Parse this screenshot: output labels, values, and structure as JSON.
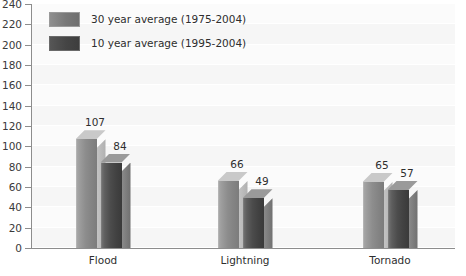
{
  "chart_data": {
    "type": "bar",
    "title": "",
    "subtitle": "",
    "xlabel": "",
    "ylabel": "",
    "categories": [
      "Flood",
      "Lightning",
      "Tornado"
    ],
    "series": [
      {
        "name": "30 year average (1975-2004)",
        "values": [
          107,
          66,
          65
        ],
        "color": "#8d8d8d"
      },
      {
        "name": "10 year average (1995-2004)",
        "values": [
          84,
          49,
          57
        ],
        "color": "#474747"
      }
    ],
    "ylim": [
      0,
      240
    ],
    "ytick_step": 20,
    "ytick_labels": [
      "0",
      "20",
      "40",
      "60",
      "80",
      "100",
      "120",
      "140",
      "160",
      "180",
      "200",
      "220",
      "240"
    ],
    "grid": true,
    "grid_axis": "y",
    "legend_position": "top-left",
    "data_labels": true,
    "three_d": true
  },
  "legend": {
    "items": [
      {
        "label": "30 year average (1975-2004)",
        "swatch": "legend-swatch-30-year"
      },
      {
        "label": "10 year average (1995-2004)",
        "swatch": "legend-swatch-10-year"
      }
    ]
  },
  "colors": {
    "plot_background": "#fbfbfb",
    "gridline": "#ffffff",
    "band": "#f6f6f6",
    "axis": "#8d8d8d",
    "text": "#2e2e2e",
    "series_light": "#8d8d8d",
    "series_dark": "#474747"
  }
}
